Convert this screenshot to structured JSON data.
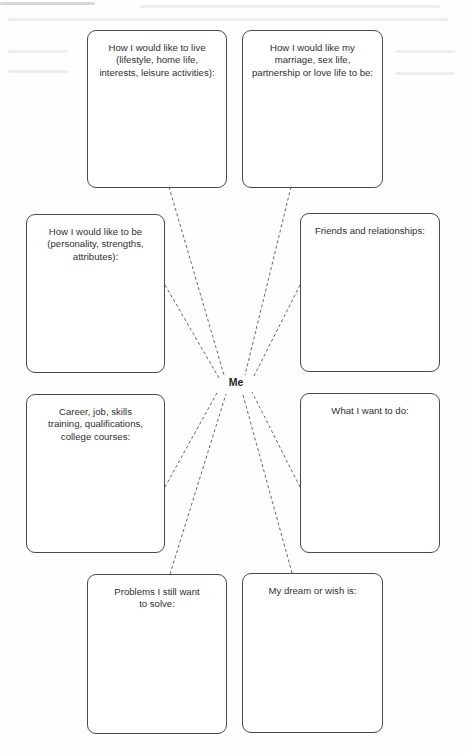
{
  "diagram": {
    "type": "mind-map worksheet",
    "center": {
      "label": "Me"
    },
    "boxes": [
      {
        "id": "lifestyle",
        "label": "How I would like to live\n(lifestyle, home life,\ninterests, leisure activities):",
        "position": "top-left"
      },
      {
        "id": "relationship",
        "label": "How I would like my\nmarriage, sex life,\npartnership or love life to be:",
        "position": "top-right"
      },
      {
        "id": "personality",
        "label": "How I would like to be\n(personality, strengths,\nattributes):",
        "position": "upper-left"
      },
      {
        "id": "friends",
        "label": "Friends and relationships:",
        "position": "upper-right"
      },
      {
        "id": "career",
        "label": "Career, job, skills\ntraining, qualifications,\ncollege courses:",
        "position": "lower-left"
      },
      {
        "id": "want-to-do",
        "label": "What I want to do:",
        "position": "lower-right"
      },
      {
        "id": "problems",
        "label": "Problems I still want\nto solve:",
        "position": "bottom-left"
      },
      {
        "id": "dream",
        "label": "My dream or wish is:",
        "position": "bottom-right"
      }
    ],
    "connector_style": "dashed",
    "colors": {
      "border": "#4a4a4a",
      "text": "#2f2f2f",
      "connector": "#555555",
      "background": "#ffffff"
    }
  }
}
